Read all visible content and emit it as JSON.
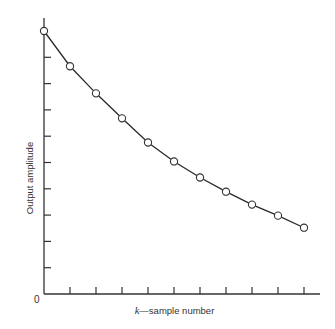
{
  "chart_data": {
    "type": "line",
    "title": "",
    "xlabel": "k—sample number",
    "xlabel_var": "k",
    "xlabel_rest": "—sample number",
    "ylabel": "Output amplitude",
    "origin_label": "0",
    "x": [
      0,
      1,
      2,
      3,
      4,
      5,
      6,
      7,
      8,
      9,
      10
    ],
    "series": [
      {
        "name": "Output amplitude",
        "marker": "hollow-circle",
        "values": [
          10.0,
          8.66,
          7.63,
          6.68,
          5.76,
          5.04,
          4.43,
          3.89,
          3.4,
          2.98,
          2.52
        ]
      }
    ],
    "xlim": [
      0,
      10.6
    ],
    "ylim": [
      0,
      10.5
    ],
    "x_ticks": [
      1,
      2,
      3,
      4,
      5,
      6,
      7,
      8,
      9,
      10
    ],
    "y_ticks": [
      1,
      2,
      3,
      4,
      5,
      6,
      7,
      8,
      9
    ],
    "tick_labels_shown": false,
    "grid": false,
    "legend": null
  },
  "layout": {
    "origin_px": [
      44,
      294
    ],
    "x_unit_px": 26,
    "y_unit_px": 26.3,
    "x_axis_end_px": 320,
    "y_axis_top_px": 18,
    "tick_len_px": 7,
    "marker_radius_px": 3.6
  },
  "colors": {
    "axis": "#333333",
    "line": "#2a2a2a",
    "marker_fill": "#ffffff",
    "background": "#ffffff"
  }
}
